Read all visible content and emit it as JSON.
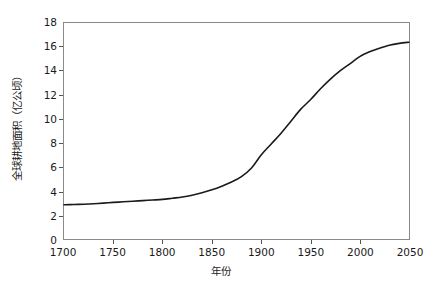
{
  "chart_data": {
    "type": "line",
    "title": "",
    "xlabel": "年份",
    "ylabel": "全球耕地面积（亿公顷）",
    "xlim": [
      1700,
      2050
    ],
    "ylim": [
      0,
      18
    ],
    "xticks": [
      1700,
      1750,
      1800,
      1850,
      1900,
      1950,
      2000,
      2050
    ],
    "yticks": [
      0,
      2,
      4,
      6,
      8,
      10,
      12,
      14,
      16,
      18
    ],
    "grid": false,
    "legend": null,
    "series": [
      {
        "name": "全球耕地面积",
        "color": "#1a1a1a",
        "x": [
          1700,
          1710,
          1720,
          1730,
          1740,
          1750,
          1760,
          1770,
          1780,
          1790,
          1800,
          1810,
          1820,
          1830,
          1840,
          1850,
          1860,
          1870,
          1880,
          1890,
          1900,
          1910,
          1920,
          1930,
          1940,
          1950,
          1960,
          1970,
          1980,
          1990,
          2000,
          2010,
          2020,
          2030,
          2040,
          2050
        ],
        "y": [
          2.85,
          2.87,
          2.9,
          2.94,
          2.99,
          3.05,
          3.1,
          3.15,
          3.2,
          3.25,
          3.3,
          3.4,
          3.5,
          3.65,
          3.85,
          4.1,
          4.4,
          4.75,
          5.2,
          5.9,
          7.0,
          7.9,
          8.8,
          9.8,
          10.8,
          11.6,
          12.5,
          13.3,
          14.0,
          14.6,
          15.2,
          15.6,
          15.9,
          16.15,
          16.3,
          16.4
        ]
      }
    ]
  },
  "axes": {
    "x_tick_labels": [
      "1700",
      "1750",
      "1800",
      "1850",
      "1900",
      "1950",
      "2000",
      "2050"
    ],
    "y_tick_labels": [
      "0",
      "2",
      "4",
      "6",
      "8",
      "10",
      "12",
      "14",
      "16",
      "18"
    ],
    "x_axis_title": "年份",
    "y_axis_title": "全球耕地面积（亿公顷）"
  },
  "style": {
    "frame_color": "#8a8a8a",
    "curve_color": "#1a1a1a",
    "text_color": "#1a1a1a",
    "background": "#ffffff"
  }
}
